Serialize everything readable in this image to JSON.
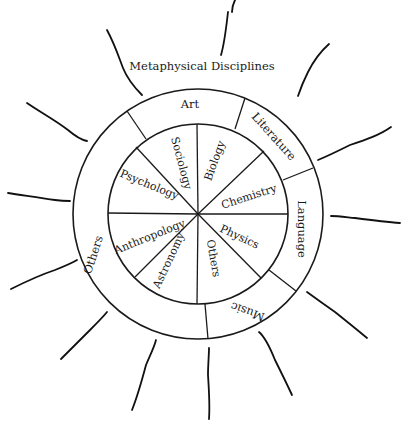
{
  "diagram": {
    "title": "Metaphysical Disciplines",
    "outer_ring": {
      "segments": [
        {
          "label": "Art"
        },
        {
          "label": "Literature"
        },
        {
          "label": "Language"
        },
        {
          "label": "Music"
        },
        {
          "label": "Others"
        }
      ]
    },
    "inner_circle": {
      "segments": [
        {
          "label": "Sociology"
        },
        {
          "label": "Biology"
        },
        {
          "label": "Chemistry"
        },
        {
          "label": "Physics"
        },
        {
          "label": "Others"
        },
        {
          "label": "Astronomy"
        },
        {
          "label": "Anthropology"
        },
        {
          "label": "Psychology"
        }
      ]
    },
    "rays_count": 14,
    "line_color": "#1a1a1a",
    "background": "#ffffff"
  }
}
